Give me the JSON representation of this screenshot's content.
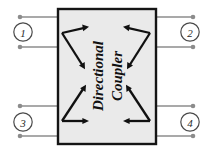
{
  "diagram": {
    "device": {
      "label_line1": "Directional",
      "label_line2": "Coupler",
      "fill_color": "#eaeaea",
      "border_color": "#151515"
    },
    "colors": {
      "background": "#ffffff",
      "lead_line": "#8c8c8c",
      "terminal_dot": "#8c8c8c",
      "port_circle_stroke": "#4a4a4a",
      "arrow": "#111111"
    },
    "ports": [
      {
        "id": "port-1",
        "label": "1",
        "cx": 23,
        "cy": 32,
        "position": "top-left"
      },
      {
        "id": "port-2",
        "label": "2",
        "cx": 190,
        "cy": 32,
        "position": "top-right"
      },
      {
        "id": "port-3",
        "label": "3",
        "cx": 23,
        "cy": 122,
        "position": "bottom-left"
      },
      {
        "id": "port-4",
        "label": "4",
        "cx": 190,
        "cy": 122,
        "position": "bottom-right"
      }
    ],
    "coupling_paths": [
      {
        "id": "path-top-left",
        "name": "through-and-coupled-from-port-1",
        "vertex": [
          62,
          33
        ],
        "tip_a": [
          89,
          27
        ],
        "tip_b": [
          85,
          69
        ]
      },
      {
        "id": "path-top-right",
        "name": "through-and-coupled-from-port-2",
        "vertex": [
          150,
          33
        ],
        "tip_a": [
          123,
          27
        ],
        "tip_b": [
          127,
          69
        ]
      },
      {
        "id": "path-bottom-left",
        "name": "through-and-coupled-from-port-3",
        "vertex": [
          62,
          121
        ],
        "tip_a": [
          86,
          85
        ],
        "tip_b": [
          89,
          121
        ]
      },
      {
        "id": "path-bottom-right",
        "name": "through-and-coupled-from-port-4",
        "vertex": [
          150,
          121
        ],
        "tip_a": [
          126,
          85
        ],
        "tip_b": [
          123,
          121
        ]
      }
    ]
  }
}
